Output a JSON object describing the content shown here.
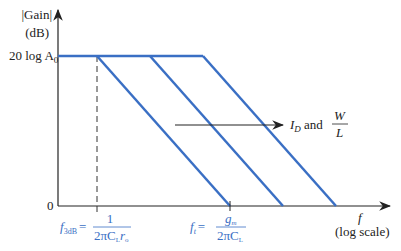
{
  "chart_data": {
    "type": "line",
    "title": "",
    "ylabel": [
      "|Gain|",
      "(dB)"
    ],
    "xlabel": [
      "f",
      "(log scale)"
    ],
    "y_ticks": [
      {
        "label": "20 log A",
        "subscript": "0",
        "value": "20logA0"
      },
      {
        "label": "0",
        "value": 0
      }
    ],
    "series": [
      {
        "name": "response-1",
        "pole": "f3dB",
        "unity_gain": "ft"
      },
      {
        "name": "response-2"
      },
      {
        "name": "response-3"
      }
    ],
    "annotations": {
      "f3dB": {
        "lhs": "f",
        "lhs_sub": "3dB",
        "eq": "=",
        "num": "1",
        "den": "2πC",
        "den_sub1": "L",
        "den_tail": "r",
        "den_sub2": "o"
      },
      "ft": {
        "lhs": "f",
        "lhs_sub": "t",
        "eq": "=",
        "num": "g",
        "num_sub": "m",
        "den": "2πC",
        "den_sub": "L"
      },
      "arrow_label": {
        "I": "I",
        "I_sub": "D",
        "and": " and ",
        "num": "W",
        "den": "L"
      }
    },
    "colors": {
      "curve": "#3a6fc4",
      "axis": "#222222",
      "annotation": "#3a6fc4"
    }
  }
}
